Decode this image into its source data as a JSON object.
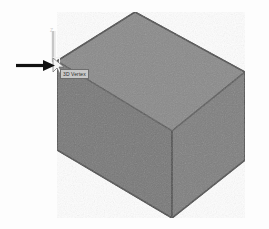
{
  "scene": {
    "background_color": "#fdfdfd",
    "title": "3D solid box isometric view with vertex snap",
    "axis_indicator": {
      "label": "Z",
      "color": "#cfcfcf"
    },
    "solid": {
      "name": "rectangular box",
      "top_face_color": "#8a8a8a",
      "left_face_color": "#787878",
      "right_face_color": "#7f7f7f",
      "edge_color": "#5d5d5d"
    }
  },
  "tooltip": {
    "text": "3D Vertex",
    "background_color": "#c9c9c9",
    "border_color": "#6e6e6e",
    "text_color": "#2b2b2b"
  },
  "cursor": {
    "name": "arrow-cursor",
    "color": "#f2f2f2"
  },
  "annotation": {
    "arrow": {
      "name": "pointer-arrow",
      "direction": "right",
      "color": "#111111"
    }
  }
}
